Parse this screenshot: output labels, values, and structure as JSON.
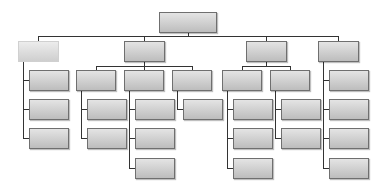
{
  "diagram": {
    "type": "org-chart",
    "root": {
      "label": "",
      "x": 159,
      "y": 12,
      "w": 58
    },
    "level1": [
      {
        "label": "",
        "x": 18,
        "y": 41,
        "w": 41,
        "style": "light"
      },
      {
        "label": "",
        "x": 124,
        "y": 41,
        "w": 41
      },
      {
        "label": "",
        "x": 246,
        "y": 41,
        "w": 41
      },
      {
        "label": "",
        "x": 318,
        "y": 41,
        "w": 41
      }
    ],
    "colors": {
      "box_top": "#e4e4e4",
      "box_bottom": "#bdbdbd",
      "border": "#6f6f6f",
      "connector": "#333333"
    }
  }
}
